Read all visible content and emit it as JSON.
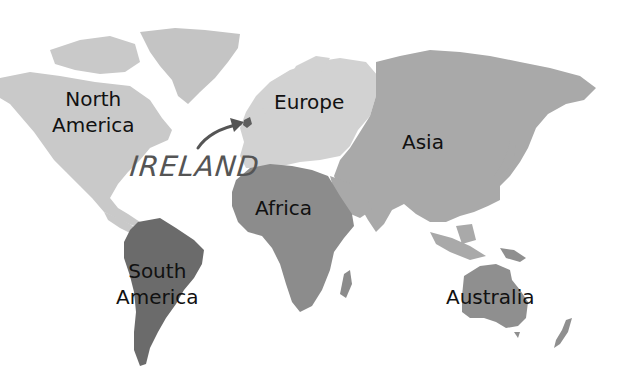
{
  "map": {
    "type": "world-continents",
    "colors": {
      "background": "#ffffff",
      "north_america": "#c9c9c9",
      "greenland": "#c4c4c4",
      "europe": "#d2d2d2",
      "asia": "#a9a9a9",
      "africa": "#8c8c8c",
      "south_america": "#6b6b6b",
      "australia": "#8f8f8f",
      "ireland": "#5e5e5e",
      "arrow": "#555555",
      "label_text": "#111111"
    },
    "continents": [
      {
        "id": "north-america",
        "line1": "North",
        "line2": "America"
      },
      {
        "id": "europe",
        "line1": "Europe"
      },
      {
        "id": "asia",
        "line1": "Asia"
      },
      {
        "id": "africa",
        "line1": "Africa"
      },
      {
        "id": "south-america",
        "line1": "South",
        "line2": "America"
      },
      {
        "id": "australia",
        "line1": "Australia"
      }
    ],
    "highlight": {
      "label": "IRELAND",
      "icon": "arrow-icon"
    }
  }
}
